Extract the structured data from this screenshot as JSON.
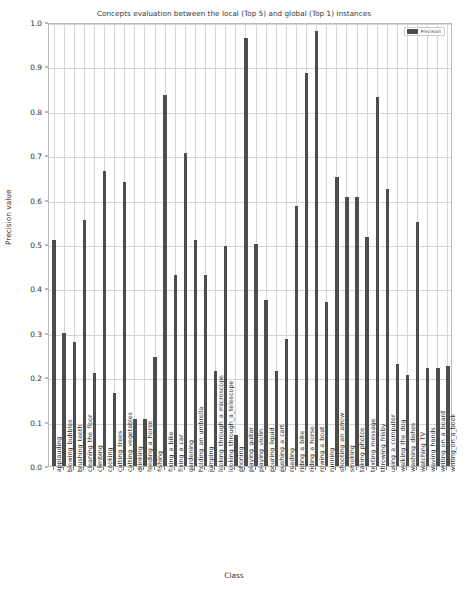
{
  "chart_data": {
    "type": "bar",
    "title": "Concepts evaluation between the local (Top 5) and global (Top 1) instances",
    "xlabel": "Class",
    "ylabel": "Precision value",
    "ylim": [
      0.0,
      1.0
    ],
    "grid": true,
    "legend": {
      "position": "top-right",
      "entries": [
        {
          "label": "Precision",
          "color": "#4d4d4d"
        }
      ]
    },
    "ytick_labels": [
      "0.0",
      "0.1",
      "0.2",
      "0.3",
      "0.4",
      "0.5",
      "0.6",
      "0.7",
      "0.8",
      "0.9",
      "1.0"
    ],
    "ytick_values": [
      0.0,
      0.1,
      0.2,
      0.3,
      0.4,
      0.5,
      0.6,
      0.7,
      0.8,
      0.9,
      1.0
    ],
    "bar_color": "#4d4d4d",
    "categories": [
      "applauding",
      "blowing_bubbles",
      "brushing_teeth",
      "cleaning_the_floor",
      "climbing",
      "cooking",
      "cutting_trees",
      "cutting_vegetables",
      "drinking",
      "feeding_a_horse",
      "fishing",
      "fixing_a_bike",
      "fixing_a_car",
      "gardening",
      "holding_an_umbrella",
      "jumping",
      "looking_through_a_microscope",
      "looking_through_a_telescope",
      "phoning",
      "playing_guitar",
      "playing_violin",
      "pouring_liquid",
      "pushing_a_cart",
      "reading",
      "riding_a_bike",
      "riding_a_horse",
      "rowing_a_boat",
      "running",
      "shooting_an_arrow",
      "smoking",
      "taking_photos",
      "texting_message",
      "throwing_frisby",
      "using_a_computer",
      "walking_the_dog",
      "washing_dishes",
      "watching_TV",
      "waving_hands",
      "writing_on_a_board",
      "writing_on_a_book"
    ],
    "values": [
      0.51,
      0.3,
      0.28,
      0.555,
      0.21,
      0.665,
      0.165,
      0.64,
      0.105,
      0.105,
      0.245,
      0.835,
      0.43,
      0.705,
      0.51,
      0.43,
      0.215,
      0.495,
      0.07,
      0.965,
      0.5,
      0.375,
      0.215,
      0.285,
      0.585,
      0.885,
      0.98,
      0.37,
      0.65,
      0.605,
      0.605,
      0.515,
      0.83,
      0.625,
      0.23,
      0.205,
      0.55,
      0.22,
      0.22,
      0.225
    ]
  }
}
